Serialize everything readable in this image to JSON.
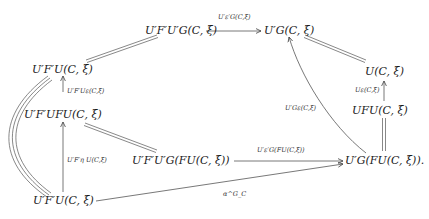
{
  "diagram": {
    "type": "commutative-diagram",
    "nodes": {
      "top_left": "U′F′U′G(C, ξ)",
      "top_right": "U′G(C, ξ)",
      "left_upper": "U′F′U(C, ξ)",
      "left_middle": "U′F′UFU(C, ξ)",
      "center": "U′F′U′G(FU(C, ξ))",
      "bottom_left": "U′F′U(C, ξ)",
      "right_upper": "U(C, ξ)",
      "right_middle": "UFU(C, ξ)",
      "bottom_right": "U′G(FU(C, ξ))."
    },
    "arrow_labels": {
      "top": "U′ε′G(C,ξ)",
      "left_upper_vertical": "U′F′Uε(C,ξ)",
      "left_lower_vertical": "U′F′η U(C,ξ)",
      "center_horizontal": "U′ε′G(FU(C,ξ))",
      "bottom_diagonal": "α^G_C",
      "curved_up": "U′Gε(C,ξ)",
      "right_vertical": "Uε(C,ξ)"
    },
    "colors": {
      "ink": "#1a1a1a",
      "arrow": "#555555",
      "background": "#ffffff"
    }
  }
}
